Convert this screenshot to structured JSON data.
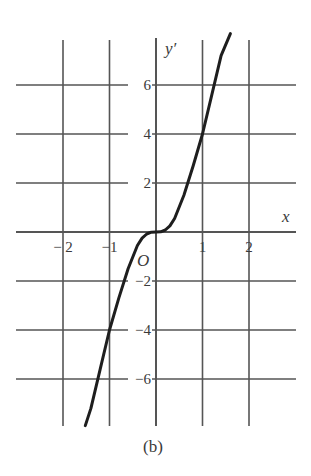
{
  "chart_data": {
    "type": "line",
    "title": "",
    "caption": "(b)",
    "xlabel": "x",
    "ylabel": "y′",
    "origin_label": "O",
    "xlim": [
      -3.0,
      3.0
    ],
    "ylim": [
      -8.3,
      8.2
    ],
    "grid": true,
    "x_ticks": [
      -2,
      -1,
      1,
      2
    ],
    "x_tick_labels": [
      "− 2",
      "−1",
      "1",
      "2"
    ],
    "y_ticks": [
      6,
      4,
      2,
      -2,
      -4,
      -6
    ],
    "y_tick_labels": [
      "6",
      "4",
      "2",
      "−2",
      "−4",
      "−6"
    ],
    "series": [
      {
        "name": "y′",
        "x": [
          -1.52,
          -1.4,
          -1.2,
          -1.0,
          -0.8,
          -0.6,
          -0.4,
          -0.3,
          -0.2,
          -0.1,
          0.0,
          0.1,
          0.2,
          0.3,
          0.4,
          0.6,
          0.8,
          1.0,
          1.2,
          1.4,
          1.6
        ],
        "y": [
          -7.9,
          -7.2,
          -5.6,
          -4.0,
          -2.7,
          -1.5,
          -0.55,
          -0.25,
          -0.08,
          -0.01,
          0.0,
          0.01,
          0.08,
          0.25,
          0.55,
          1.5,
          2.7,
          4.0,
          5.6,
          7.2,
          8.1
        ]
      }
    ]
  }
}
